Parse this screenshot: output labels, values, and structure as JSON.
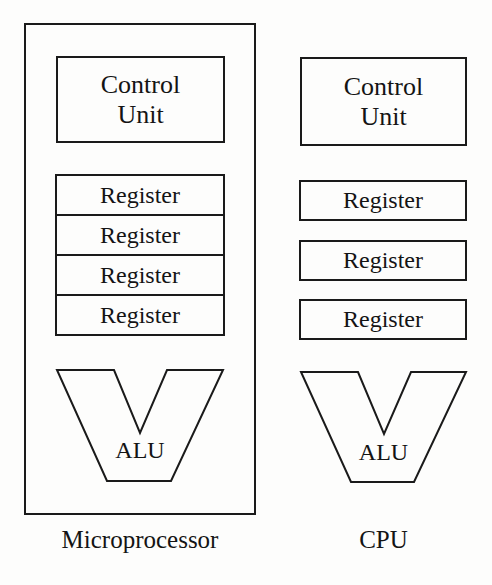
{
  "diagram": {
    "background_color": "#fdfdfc",
    "stroke_color": "#1a1a1a",
    "text_color": "#141414",
    "columns": [
      {
        "id": "microprocessor",
        "caption": "Microprocessor",
        "has_outer_chip_boundary": true,
        "control_unit": {
          "line1": "Control",
          "line2": "Unit"
        },
        "registers": [
          "Register",
          "Register",
          "Register",
          "Register"
        ],
        "register_layout": "contiguous-stack",
        "alu": {
          "label": "ALU",
          "shape": "v-funnel"
        }
      },
      {
        "id": "cpu",
        "caption": "CPU",
        "has_outer_chip_boundary": false,
        "control_unit": {
          "line1": "Control",
          "line2": "Unit"
        },
        "registers": [
          "Register",
          "Register",
          "Register"
        ],
        "register_layout": "separated-boxes",
        "alu": {
          "label": "ALU",
          "shape": "v-funnel"
        }
      }
    ]
  }
}
